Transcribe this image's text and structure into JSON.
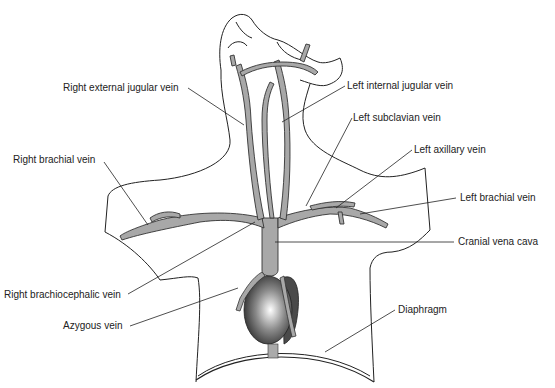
{
  "diagram": {
    "labels": [
      {
        "id": "right-external-jugular-vein",
        "text": "Right external jugular vein",
        "x": 63,
        "y": 82
      },
      {
        "id": "left-internal-jugular-vein",
        "text": "Left internal jugular vein",
        "x": 347,
        "y": 80
      },
      {
        "id": "left-subclavian-vein",
        "text": "Left subclavian vein",
        "x": 353,
        "y": 112
      },
      {
        "id": "right-brachial-vein",
        "text": "Right brachial vein",
        "x": 13,
        "y": 154
      },
      {
        "id": "left-axillary-vein",
        "text": "Left axillary vein",
        "x": 414,
        "y": 144
      },
      {
        "id": "left-brachial-vein",
        "text": "Left brachial vein",
        "x": 460,
        "y": 192
      },
      {
        "id": "cranial-vena-cava",
        "text": "Cranial vena cava",
        "x": 458,
        "y": 236
      },
      {
        "id": "right-brachiocephalic-vein",
        "text": "Right brachiocephalic vein",
        "x": 4,
        "y": 289
      },
      {
        "id": "azygous-vein",
        "text": "Azygous vein",
        "x": 63,
        "y": 320
      },
      {
        "id": "diaphragm",
        "text": "Diaphragm",
        "x": 398,
        "y": 304
      }
    ],
    "colors": {
      "vein_fill": "#a8a8a8",
      "outline": "#222222",
      "heart_dark": "#333333",
      "heart_light": "#ffffff"
    }
  }
}
